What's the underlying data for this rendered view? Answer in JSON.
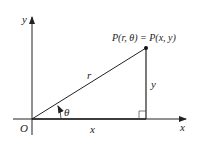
{
  "diagram": {
    "type": "polar-cartesian-relation",
    "labels": {
      "y_axis": "y",
      "x_axis": "x",
      "origin": "O",
      "point": "P(r, θ) = P(x, y)",
      "radius": "r",
      "angle": "θ",
      "horizontal_leg": "x",
      "vertical_leg": "y"
    },
    "colors": {
      "line": "#222222",
      "background": "#ffffff"
    }
  }
}
